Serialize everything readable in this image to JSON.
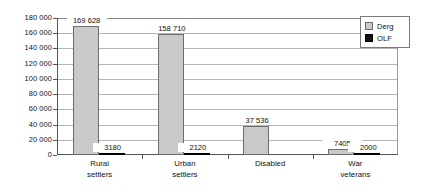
{
  "chart_data": {
    "type": "bar",
    "title": "",
    "subtitle": "",
    "xlabel": "",
    "ylabel": "",
    "ylim": [
      0,
      180000
    ],
    "grid": true,
    "legend_position": "top-right",
    "categories": [
      "Rural\nsettlers",
      "Urban\nsettlers",
      "Disabled",
      "War\nveterans"
    ],
    "series": [
      {
        "name": "Derg",
        "color": "#c9c9c9",
        "values": [
          169628,
          158710,
          37536,
          7405
        ],
        "value_labels": [
          "169 628",
          "158 710",
          "37 536",
          "7405"
        ]
      },
      {
        "name": "OLF",
        "color": "#111111",
        "values": [
          3180,
          2120,
          null,
          2000
        ],
        "value_labels": [
          "3180",
          "2120",
          "",
          "2000"
        ]
      }
    ],
    "ytick_values": [
      0,
      20000,
      40000,
      60000,
      80000,
      100000,
      120000,
      140000,
      160000,
      180000
    ],
    "ytick_labels": [
      "0",
      "20 000",
      "40 000",
      "60 000",
      "80 000",
      "100 000",
      "120 000",
      "140 000",
      "160 000",
      "180 000"
    ]
  },
  "legend": {
    "items": [
      {
        "label": "Derg",
        "swatch": "legend-swatch-derg"
      },
      {
        "label": "OLF",
        "swatch": "legend-swatch-olf"
      }
    ]
  }
}
